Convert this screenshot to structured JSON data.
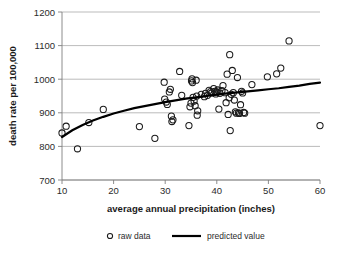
{
  "chart_data": {
    "type": "scatter",
    "title": "",
    "xlabel": "average annual precipitation (inches)",
    "ylabel": "death rate per 100,000",
    "xlim": [
      10,
      60
    ],
    "ylim": [
      700,
      1200
    ],
    "xticks": [
      10,
      20,
      30,
      40,
      50,
      60
    ],
    "yticks": [
      700,
      800,
      900,
      1000,
      1100,
      1200
    ],
    "grid": true,
    "legend_position": "bottom",
    "legend": [
      {
        "label": "raw data",
        "marker": "open-circle"
      },
      {
        "label": "predicted value",
        "marker": "line"
      }
    ],
    "series": [
      {
        "name": "raw data",
        "marker": "open-circle",
        "points": [
          [
            10.0,
            840
          ],
          [
            10.8,
            860
          ],
          [
            13.0,
            793
          ],
          [
            15.2,
            871
          ],
          [
            18.0,
            910
          ],
          [
            25.0,
            859
          ],
          [
            28.0,
            824
          ],
          [
            29.8,
            991
          ],
          [
            29.9,
            941
          ],
          [
            30.2,
            932
          ],
          [
            30.4,
            925
          ],
          [
            30.8,
            962
          ],
          [
            31.0,
            970
          ],
          [
            31.2,
            890
          ],
          [
            31.3,
            874
          ],
          [
            31.5,
            879
          ],
          [
            32.8,
            1023
          ],
          [
            33.2,
            952
          ],
          [
            34.6,
            862
          ],
          [
            34.8,
            918
          ],
          [
            35.0,
            929
          ],
          [
            35.1,
            995
          ],
          [
            35.2,
            1001
          ],
          [
            35.3,
            990
          ],
          [
            35.4,
            946
          ],
          [
            35.6,
            935
          ],
          [
            35.8,
            921
          ],
          [
            36.0,
            997
          ],
          [
            36.1,
            950
          ],
          [
            36.2,
            893
          ],
          [
            36.3,
            906
          ],
          [
            37.0,
            955
          ],
          [
            37.6,
            948
          ],
          [
            37.8,
            958
          ],
          [
            38.2,
            952
          ],
          [
            38.5,
            967
          ],
          [
            38.8,
            963
          ],
          [
            39.0,
            959
          ],
          [
            39.4,
            972
          ],
          [
            39.6,
            964
          ],
          [
            39.8,
            956
          ],
          [
            40.0,
            962
          ],
          [
            40.2,
            968
          ],
          [
            40.4,
            911
          ],
          [
            40.6,
            958
          ],
          [
            41.0,
            966
          ],
          [
            41.2,
            981
          ],
          [
            41.6,
            960
          ],
          [
            41.8,
            930
          ],
          [
            42.0,
            1015
          ],
          [
            42.2,
            895
          ],
          [
            42.4,
            945
          ],
          [
            42.5,
            1073
          ],
          [
            42.6,
            847
          ],
          [
            42.8,
            955
          ],
          [
            43.0,
            1026
          ],
          [
            43.2,
            960
          ],
          [
            43.4,
            938
          ],
          [
            43.6,
            903
          ],
          [
            43.8,
            899
          ],
          [
            44.0,
            1005
          ],
          [
            44.2,
            900
          ],
          [
            44.4,
            898
          ],
          [
            44.6,
            924
          ],
          [
            44.8,
            964
          ],
          [
            45.0,
            959
          ],
          [
            45.2,
            901
          ],
          [
            45.4,
            899
          ],
          [
            46.8,
            984
          ],
          [
            49.8,
            1007
          ],
          [
            51.6,
            1016
          ],
          [
            52.4,
            1033
          ],
          [
            54.0,
            1114
          ],
          [
            60.0,
            862
          ]
        ]
      },
      {
        "name": "predicted value",
        "type": "line",
        "points": [
          [
            10,
            828
          ],
          [
            12,
            848
          ],
          [
            14,
            864
          ],
          [
            16,
            877
          ],
          [
            18,
            888
          ],
          [
            20,
            898
          ],
          [
            22,
            906
          ],
          [
            24,
            914
          ],
          [
            26,
            920
          ],
          [
            28,
            926
          ],
          [
            30,
            932
          ],
          [
            32,
            937
          ],
          [
            34,
            942
          ],
          [
            36,
            946
          ],
          [
            38,
            950
          ],
          [
            40,
            954
          ],
          [
            42,
            958
          ],
          [
            44,
            961
          ],
          [
            46,
            964
          ],
          [
            48,
            967
          ],
          [
            50,
            970
          ],
          [
            52,
            973
          ],
          [
            54,
            977
          ],
          [
            56,
            981
          ],
          [
            58,
            986
          ],
          [
            60,
            990
          ]
        ]
      }
    ]
  }
}
